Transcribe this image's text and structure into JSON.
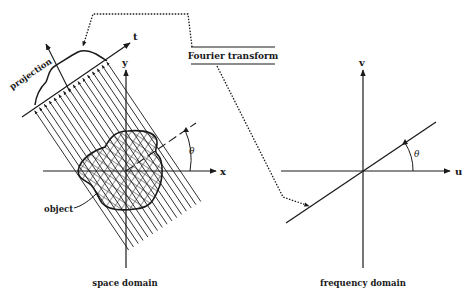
{
  "labels": {
    "fourier_transform": "Fourier transform",
    "projection": "projection",
    "object": "object",
    "t_axis": "t",
    "x_axis": "x",
    "y_axis": "y",
    "u_axis": "u",
    "v_axis": "v",
    "theta_space": "θ",
    "theta_freq": "θ",
    "space_caption": "space domain",
    "frequency_caption": "frequency domain"
  },
  "colors": {
    "ink": "#1a1a1a",
    "background": "#ffffff"
  },
  "geometry": {
    "space_origin": [
      126,
      171
    ],
    "freq_origin": [
      363,
      171
    ],
    "projection_angle_deg": 34,
    "ray_count": 16,
    "ray_length": 170
  }
}
